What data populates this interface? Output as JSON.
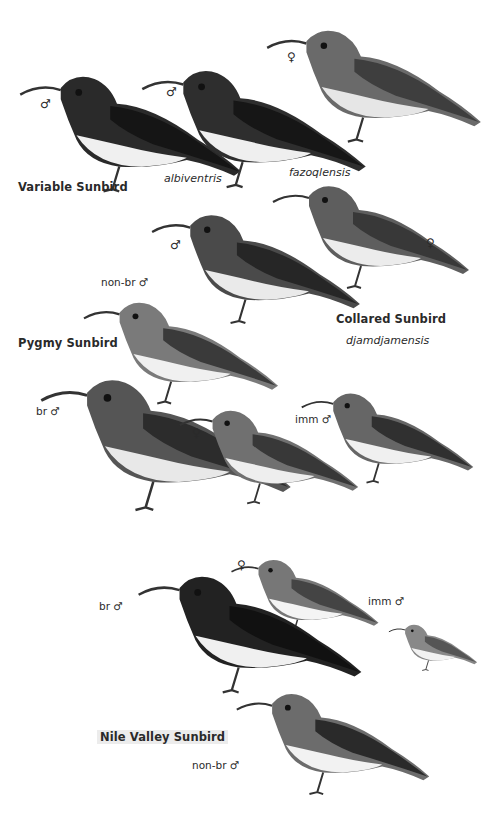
{
  "plate": {
    "background": "#ffffff",
    "ink_colors": {
      "dark": "#1a1a1a",
      "mid": "#5a5a5a",
      "light": "#c8c8c8",
      "belly": "#eeeeee"
    }
  },
  "species": [
    {
      "name": "Variable Sunbird",
      "subspecies": [
        "albiventris",
        "fazoqlensis"
      ],
      "figures": [
        {
          "id": "variable-male-albiventris",
          "sex_symbol": "♂",
          "age_label": ""
        },
        {
          "id": "variable-male-fazoqlensis",
          "sex_symbol": "♂",
          "age_label": ""
        },
        {
          "id": "variable-female",
          "sex_symbol": "♀",
          "age_label": ""
        }
      ]
    },
    {
      "name": "Collared Sunbird",
      "subspecies": [
        "djamdjamensis"
      ],
      "figures": [
        {
          "id": "collared-male",
          "sex_symbol": "♂",
          "age_label": ""
        },
        {
          "id": "collared-female",
          "sex_symbol": "♀",
          "age_label": ""
        }
      ]
    },
    {
      "name": "Pygmy Sunbird",
      "subspecies": [],
      "figures": [
        {
          "id": "pygmy-nonbr-male",
          "sex_symbol": "♂",
          "age_label": "non-br"
        },
        {
          "id": "pygmy-br-male",
          "sex_symbol": "♂",
          "age_label": "br"
        },
        {
          "id": "pygmy-female",
          "sex_symbol": "♀",
          "age_label": ""
        },
        {
          "id": "pygmy-imm-male",
          "sex_symbol": "♂",
          "age_label": "imm"
        }
      ]
    },
    {
      "name": "Nile Valley Sunbird",
      "subspecies": [],
      "figures": [
        {
          "id": "nile-female",
          "sex_symbol": "♀",
          "age_label": ""
        },
        {
          "id": "nile-br-male",
          "sex_symbol": "♂",
          "age_label": "br"
        },
        {
          "id": "nile-imm-male",
          "sex_symbol": "♂",
          "age_label": "imm"
        },
        {
          "id": "nile-nonbr-male",
          "sex_symbol": "♂",
          "age_label": "non-br"
        }
      ]
    }
  ],
  "labels": {
    "variable_name": "Variable Sunbird",
    "albiventris": "albiventris",
    "fazoqlensis": "fazoqlensis",
    "collared_name": "Collared Sunbird",
    "djamdjamensis": "djamdjamensis",
    "pygmy_name": "Pygmy Sunbird",
    "nile_name": "Nile Valley Sunbird",
    "male": "♂",
    "female": "♀",
    "non_br_male": "non-br ♂",
    "br_male": "br ♂",
    "imm_male": "imm ♂"
  }
}
